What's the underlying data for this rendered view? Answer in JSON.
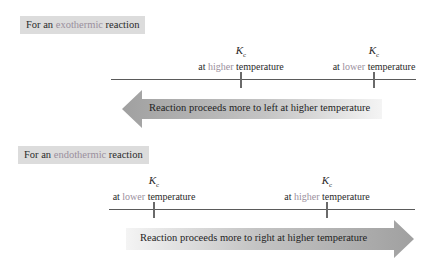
{
  "exothermic": {
    "label": {
      "prefix": "For an ",
      "highlight": "exothermic",
      "suffix": " reaction"
    },
    "markers": [
      {
        "symbol": "K",
        "subscript": "c",
        "pre": "at ",
        "highlight": "higher",
        "post": " temperature"
      },
      {
        "symbol": "K",
        "subscript": "c",
        "pre": "at ",
        "highlight": "lower",
        "post": " temperature"
      }
    ],
    "arrow": {
      "direction": "left",
      "text": "Reaction proceeds more to left at higher temperature"
    }
  },
  "endothermic": {
    "label": {
      "prefix": "For an ",
      "highlight": "endothermic",
      "suffix": " reaction"
    },
    "markers": [
      {
        "symbol": "K",
        "subscript": "c",
        "pre": "at ",
        "highlight": "lower",
        "post": " temperature"
      },
      {
        "symbol": "K",
        "subscript": "c",
        "pre": "at ",
        "highlight": "higher",
        "post": " temperature"
      }
    ],
    "arrow": {
      "direction": "right",
      "text": "Reaction proceeds more to right at higher temperature"
    }
  },
  "colors": {
    "highlight": "#9a8f9d",
    "label_bg": "#dcdcdc",
    "arrow_dark": "#a0a0a0",
    "arrow_light": "#f2f2f2"
  }
}
